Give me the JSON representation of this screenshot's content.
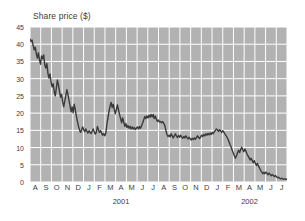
{
  "chart_data": {
    "type": "line",
    "title": "Share price ($)",
    "xlabel": "",
    "ylabel": "Share price ($)",
    "ylim": [
      0,
      45
    ],
    "ytick_values": [
      0,
      5,
      10,
      15,
      20,
      25,
      30,
      35,
      40,
      45
    ],
    "ytick_labels": [
      "0",
      "5",
      "10",
      "15",
      "20",
      "25",
      "30",
      "35",
      "40",
      "45"
    ],
    "grid": true,
    "legend": "none",
    "line_color": "#3a3a3a",
    "plot_background": "#b2b2b2",
    "gridline_color": "#ffffff",
    "x_categories": [
      "A",
      "S",
      "O",
      "N",
      "D",
      "J",
      "F",
      "M",
      "A",
      "M",
      "J",
      "J",
      "A",
      "S",
      "O",
      "N",
      "D",
      "J",
      "F",
      "M",
      "A",
      "M",
      "J",
      "J"
    ],
    "x_period_labels": [
      {
        "label": "2001",
        "at_index": 8.5
      },
      {
        "label": "2002",
        "at_index": 20.5
      }
    ],
    "x_range_start": "Aug 2000",
    "x_range_end": "Jul 2002",
    "annotations": [],
    "series": [
      {
        "name": "Share price",
        "values": [
          41.5,
          40.8,
          41.2,
          39.6,
          38.4,
          39.1,
          37.2,
          36.0,
          37.5,
          35.4,
          34.2,
          36.6,
          35.8,
          36.9,
          34.0,
          33.1,
          34.4,
          31.6,
          30.2,
          31.4,
          29.0,
          27.6,
          28.5,
          26.2,
          25.0,
          27.3,
          29.6,
          28.2,
          26.4,
          24.6,
          25.5,
          23.2,
          21.8,
          23.4,
          25.1,
          26.8,
          25.4,
          23.8,
          22.1,
          20.4,
          21.8,
          20.1,
          22.6,
          21.0,
          19.2,
          17.6,
          16.2,
          15.2,
          14.4,
          15.1,
          16.0,
          15.2,
          14.6,
          15.4,
          14.8,
          14.2,
          14.9,
          14.4,
          14.1,
          14.8,
          15.4,
          14.6,
          13.9,
          14.5,
          16.1,
          15.2,
          14.4,
          14.9,
          14.2,
          13.6,
          14.0,
          13.4,
          14.2,
          16.8,
          18.6,
          20.4,
          22.1,
          23.1,
          21.6,
          22.6,
          21.2,
          19.8,
          21.0,
          22.4,
          21.0,
          19.6,
          18.4,
          17.2,
          18.6,
          17.4,
          16.2,
          17.0,
          15.8,
          16.4,
          15.6,
          16.2,
          15.4,
          16.0,
          15.4,
          15.8,
          15.2,
          15.6,
          16.0,
          15.4,
          16.1,
          15.6,
          16.4,
          17.2,
          18.1,
          19.0,
          18.4,
          19.2,
          18.6,
          19.4,
          18.8,
          19.6,
          18.9,
          19.6,
          18.4,
          19.1,
          18.2,
          17.6,
          18.0,
          17.4,
          17.6,
          17.2,
          17.5,
          17.0,
          16.4,
          15.0,
          13.8,
          13.2,
          13.6,
          13.1,
          14.0,
          13.4,
          12.8,
          13.4,
          14.0,
          13.4,
          12.9,
          13.5,
          13.0,
          13.6,
          13.1,
          12.7,
          13.2,
          12.8,
          13.4,
          12.9,
          12.5,
          13.0,
          12.6,
          12.2,
          12.7,
          12.3,
          12.8,
          12.4,
          12.9,
          13.4,
          13.0,
          12.6,
          13.1,
          13.6,
          13.2,
          13.8,
          13.4,
          14.0,
          13.6,
          14.1,
          13.7,
          14.2,
          13.8,
          14.4,
          14.0,
          14.6,
          15.0,
          15.4,
          15.1,
          14.7,
          15.2,
          14.8,
          14.4,
          14.9,
          14.5,
          14.0,
          13.5,
          13.0,
          12.4,
          11.6,
          10.8,
          10.1,
          9.2,
          8.4,
          7.6,
          6.9,
          7.6,
          8.4,
          9.2,
          8.6,
          9.4,
          10.1,
          9.4,
          8.8,
          9.6,
          8.9,
          8.2,
          7.6,
          7.0,
          6.4,
          6.9,
          6.2,
          5.6,
          6.2,
          5.4,
          4.8,
          5.4,
          4.6,
          4.0,
          3.4,
          2.9,
          2.4,
          2.8,
          2.4,
          2.9,
          2.5,
          2.1,
          2.6,
          2.2,
          1.8,
          2.2,
          1.9,
          1.6,
          1.9,
          1.5,
          1.2,
          1.4,
          1.1,
          0.9,
          1.1,
          0.9,
          0.8,
          0.9,
          0.8,
          0.8
        ]
      }
    ]
  }
}
